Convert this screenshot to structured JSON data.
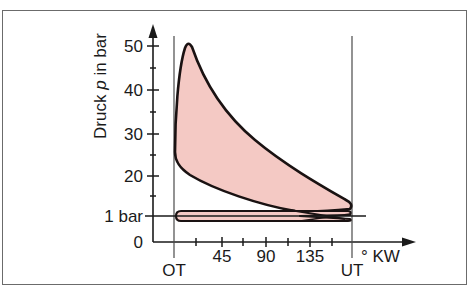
{
  "chart_data": {
    "type": "line",
    "title": "",
    "xlabel": "° KW",
    "ylabel": "Druck p in bar",
    "ylabel_italic_part": "p",
    "x_ticks": [
      {
        "label": "OT",
        "value": 0
      },
      {
        "label": "45",
        "value": 45
      },
      {
        "label": "90",
        "value": 90
      },
      {
        "label": "135",
        "value": 135
      },
      {
        "label": "UT",
        "value": 180
      }
    ],
    "x_minor_ticks": [
      22.5,
      67.5,
      112.5,
      157.5
    ],
    "y_ticks": [
      {
        "label": "0",
        "value": 0
      },
      {
        "label": "1 bar",
        "value": 1
      },
      {
        "label": "20",
        "value": 20
      },
      {
        "label": "30",
        "value": 30
      },
      {
        "label": "40",
        "value": 40
      },
      {
        "label": "50",
        "value": 50
      }
    ],
    "y_minor_ticks": [
      15,
      25,
      35,
      45
    ],
    "xlim": [
      0,
      180
    ],
    "ylim": [
      0,
      52
    ],
    "grid": false,
    "reference_lines": [
      {
        "label": "OT",
        "axis": "x",
        "value": 0
      },
      {
        "label": "UT",
        "axis": "x",
        "value": 180
      },
      {
        "label": "1 bar",
        "axis": "y",
        "value": 1
      }
    ],
    "series": [
      {
        "name": "Arbeitsschleife (Hochdruck)",
        "fill": "#f4c9c4",
        "points_upper": [
          [
            0,
            25
          ],
          [
            3,
            40
          ],
          [
            8,
            50
          ],
          [
            15,
            44
          ],
          [
            30,
            33
          ],
          [
            45,
            26
          ],
          [
            60,
            21
          ],
          [
            90,
            14
          ],
          [
            120,
            9
          ],
          [
            150,
            6
          ],
          [
            178,
            4.5
          ]
        ],
        "points_lower": [
          [
            0,
            25
          ],
          [
            2,
            20
          ],
          [
            10,
            17
          ],
          [
            30,
            14
          ],
          [
            60,
            10
          ],
          [
            90,
            7
          ],
          [
            120,
            4
          ],
          [
            150,
            2
          ],
          [
            178,
            3.5
          ]
        ]
      },
      {
        "name": "Ladungswechselschleife (Niederdruck)",
        "fill": "#f4c9c4",
        "points_upper": [
          [
            1,
            1.7
          ],
          [
            180,
            1.7
          ]
        ],
        "points_lower": [
          [
            1,
            0.3
          ],
          [
            180,
            0.3
          ]
        ]
      }
    ],
    "peak": {
      "x": 8,
      "y": 50
    }
  },
  "colors": {
    "fill": "#f4c9c4",
    "stroke": "#1a1212",
    "axis": "#1a1a1a",
    "frame": "#6b6b6b"
  }
}
